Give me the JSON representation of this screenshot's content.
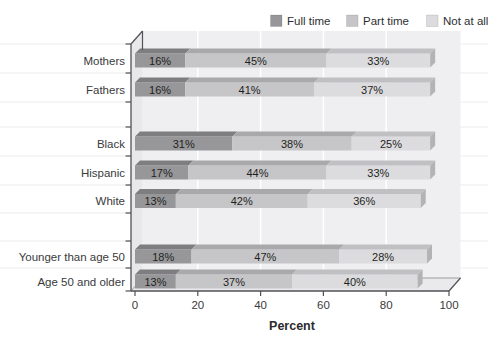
{
  "legend": {
    "position": "top-right",
    "items": [
      {
        "label": "Full time",
        "color": "#97979a"
      },
      {
        "label": "Part time",
        "color": "#c6c6c9"
      },
      {
        "label": "Not at all",
        "color": "#dcdcdf"
      }
    ]
  },
  "chart_data": {
    "type": "bar",
    "stacked": true,
    "orientation": "horizontal",
    "style": "3d",
    "title": "",
    "xlabel": "Percent",
    "xlim": [
      0,
      100
    ],
    "x_ticks": [
      "0",
      "20",
      "40",
      "60",
      "80",
      "100"
    ],
    "categories": [
      "Mothers",
      "Fathers",
      "Black",
      "Hispanic",
      "White",
      "Younger than age 50",
      "Age 50 and older"
    ],
    "groups": [
      [
        "Mothers",
        "Fathers"
      ],
      [
        "Black",
        "Hispanic",
        "White"
      ],
      [
        "Younger than age 50",
        "Age 50 and older"
      ]
    ],
    "series": [
      {
        "name": "Full time",
        "color": "#97979a",
        "values": [
          16,
          16,
          31,
          17,
          13,
          18,
          13
        ]
      },
      {
        "name": "Part time",
        "color": "#c6c6c9",
        "values": [
          45,
          41,
          38,
          44,
          42,
          47,
          37
        ]
      },
      {
        "name": "Not at all",
        "color": "#dcdcdf",
        "values": [
          33,
          37,
          25,
          33,
          36,
          28,
          40
        ]
      }
    ],
    "value_suffix": "%",
    "value_labels": "inside-segments",
    "grid": "vertical-white-lines-every-20",
    "legend_position": "top-right"
  }
}
